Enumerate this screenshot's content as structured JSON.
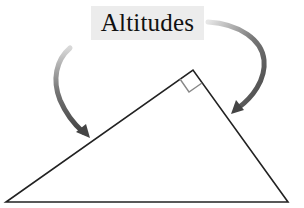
{
  "diagram": {
    "title": "Altitudes",
    "shape": "triangle",
    "vertices": {
      "bottom_left": [
        6,
        202
      ],
      "bottom_right": [
        288,
        202
      ],
      "apex": [
        193,
        70
      ]
    },
    "right_angle_marker": "apex",
    "arrows": [
      {
        "from": "label",
        "to": "left-side",
        "direction": "curved-down"
      },
      {
        "from": "label",
        "to": "right-side",
        "direction": "curved-down"
      }
    ],
    "colors": {
      "line": "#222222",
      "arrow": "#555555",
      "label_bg": "#ececec",
      "marker": "#888888"
    }
  }
}
